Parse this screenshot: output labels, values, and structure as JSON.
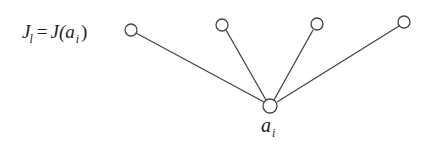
{
  "diagram": {
    "type": "star-graph",
    "stroke_color": "#444444",
    "label_color": "#222222",
    "hub": {
      "id": "hub",
      "cx": 270,
      "cy": 106,
      "r": 7,
      "label_main": "a",
      "label_sub": "i"
    },
    "leaves": [
      {
        "id": "leaf-1",
        "cx": 131,
        "cy": 30,
        "r": 6
      },
      {
        "id": "leaf-2",
        "cx": 222,
        "cy": 25,
        "r": 6
      },
      {
        "id": "leaf-3",
        "cx": 317,
        "cy": 24,
        "r": 6
      },
      {
        "id": "leaf-4",
        "cx": 404,
        "cy": 22,
        "r": 6
      }
    ],
    "leaf_label": {
      "J": "J",
      "sub_l": "l",
      "eq": "=",
      "J2": "J(",
      "a": "a",
      "sub_i": "i",
      "close": ")"
    }
  }
}
